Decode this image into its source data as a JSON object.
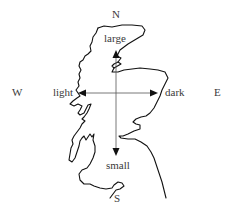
{
  "diagram": {
    "compass": {
      "north": "N",
      "south": "S",
      "west": "W",
      "east": "E"
    },
    "axes": {
      "up_label": "large",
      "down_label": "small",
      "left_label": "light",
      "right_label": "dark"
    },
    "colors": {
      "outline": "#111111",
      "axis": "#555555",
      "text": "#3a3a3a",
      "background": "#ffffff"
    }
  }
}
